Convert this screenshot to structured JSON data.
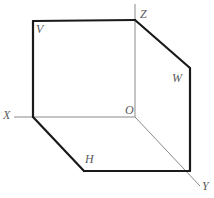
{
  "figure": {
    "colors": {
      "edge": "#1a1a1a",
      "axis": "#8a8a8c",
      "label": "#59595b",
      "background": "#ffffff"
    },
    "stroke_widths": {
      "edge": 2.2,
      "axis": 1.0
    },
    "points": {
      "Z": {
        "x": 135,
        "y": 20
      },
      "O": {
        "x": 135,
        "y": 117
      },
      "X": {
        "x": 14,
        "y": 117
      },
      "Y": {
        "x": 200,
        "y": 186
      },
      "V_top_left": {
        "x": 33,
        "y": 21
      },
      "V_bottom_left": {
        "x": 33,
        "y": 117
      },
      "W_top_right": {
        "x": 190,
        "y": 68
      },
      "W_bottom_right": {
        "x": 190,
        "y": 171
      },
      "H_bottom_left": {
        "x": 84,
        "y": 171
      },
      "Z_axis_top": {
        "x": 135,
        "y": 4
      }
    },
    "labels": [
      {
        "id": "label-Z",
        "text": "Z",
        "x": 140,
        "y": 8,
        "name": "vertex-label-z"
      },
      {
        "id": "label-V",
        "text": "V",
        "x": 36,
        "y": 23,
        "name": "plane-label-v"
      },
      {
        "id": "label-W",
        "text": "W",
        "x": 172,
        "y": 72,
        "name": "plane-label-w"
      },
      {
        "id": "label-O",
        "text": "O",
        "x": 125,
        "y": 104,
        "name": "origin-label-o"
      },
      {
        "id": "label-X",
        "text": "X",
        "x": 3,
        "y": 109,
        "name": "axis-label-x"
      },
      {
        "id": "label-H",
        "text": "H",
        "x": 85,
        "y": 153,
        "name": "plane-label-h"
      },
      {
        "id": "label-Y",
        "text": "Y",
        "x": 202,
        "y": 180,
        "name": "axis-label-y"
      }
    ],
    "edges": [
      {
        "name": "v-plane-top-edge",
        "from": "V_top_left",
        "to": "Z",
        "kind": "edge"
      },
      {
        "name": "v-plane-left-edge",
        "from": "V_top_left",
        "to": "V_bottom_left",
        "kind": "edge"
      },
      {
        "name": "w-plane-top-edge",
        "from": "Z",
        "to": "W_top_right",
        "kind": "edge"
      },
      {
        "name": "w-plane-right-edge",
        "from": "W_top_right",
        "to": "W_bottom_right",
        "kind": "edge"
      },
      {
        "name": "h-plane-left-edge",
        "from": "V_bottom_left",
        "to": "H_bottom_left",
        "kind": "edge"
      },
      {
        "name": "h-plane-bottom-edge",
        "from": "H_bottom_left",
        "to": "W_bottom_right",
        "kind": "edge"
      },
      {
        "name": "axis-z",
        "from": "Z_axis_top",
        "to": "O",
        "kind": "axis"
      },
      {
        "name": "axis-x",
        "from": "X",
        "to": "O",
        "kind": "axis"
      },
      {
        "name": "axis-y",
        "from": "O",
        "to": "Y",
        "kind": "axis"
      }
    ]
  }
}
